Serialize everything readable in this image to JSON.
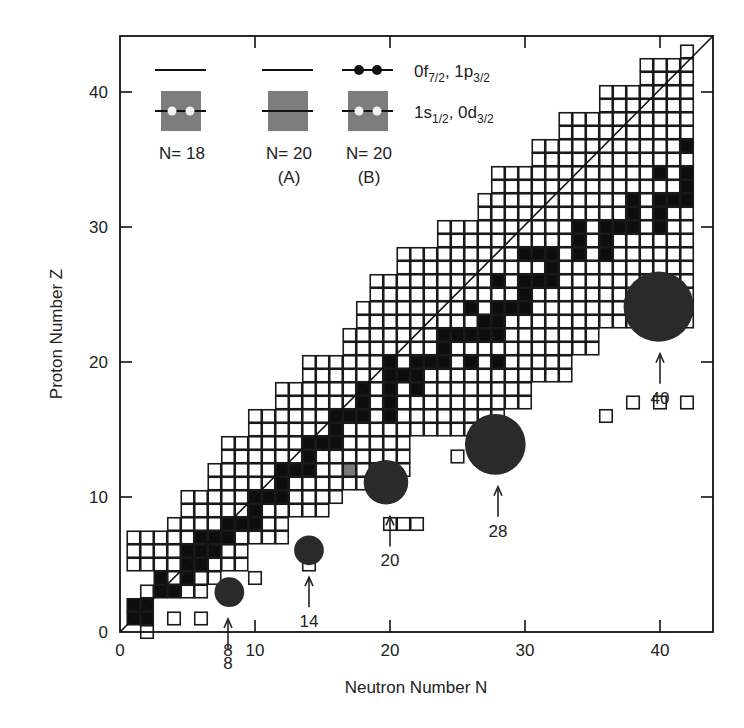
{
  "chart_data": {
    "type": "heatmap",
    "title": "",
    "xlabel": "Neutron Number N",
    "ylabel": "Proton Number Z",
    "xlim": [
      0,
      44
    ],
    "ylim": [
      0,
      44
    ],
    "x_ticks": [
      0,
      10,
      20,
      30,
      40
    ],
    "y_ticks": [
      0,
      10,
      20,
      30,
      40
    ],
    "grid": false,
    "diagonal_line": "N = Z",
    "rows": [
      {
        "z": 1,
        "nmin": 1,
        "nmax": 2
      },
      {
        "z": 2,
        "nmin": 1,
        "nmax": 2
      },
      {
        "z": 3,
        "nmin": 2,
        "nmax": 6
      },
      {
        "z": 4,
        "nmin": 3,
        "nmax": 7
      },
      {
        "z": 5,
        "nmin": 1,
        "nmax": 9
      },
      {
        "z": 6,
        "nmin": 1,
        "nmax": 9
      },
      {
        "z": 7,
        "nmin": 1,
        "nmax": 12
      },
      {
        "z": 8,
        "nmin": 4,
        "nmax": 12
      },
      {
        "z": 9,
        "nmin": 5,
        "nmax": 15
      },
      {
        "z": 10,
        "nmin": 5,
        "nmax": 16
      },
      {
        "z": 11,
        "nmin": 7,
        "nmax": 19
      },
      {
        "z": 12,
        "nmin": 7,
        "nmax": 21
      },
      {
        "z": 13,
        "nmin": 8,
        "nmax": 21
      },
      {
        "z": 14,
        "nmin": 8,
        "nmax": 21
      },
      {
        "z": 15,
        "nmin": 10,
        "nmax": 28
      },
      {
        "z": 16,
        "nmin": 10,
        "nmax": 28
      },
      {
        "z": 17,
        "nmin": 12,
        "nmax": 30
      },
      {
        "z": 18,
        "nmin": 12,
        "nmax": 30
      },
      {
        "z": 19,
        "nmin": 14,
        "nmax": 33
      },
      {
        "z": 20,
        "nmin": 14,
        "nmax": 33
      },
      {
        "z": 21,
        "nmin": 17,
        "nmax": 35
      },
      {
        "z": 22,
        "nmin": 17,
        "nmax": 35
      },
      {
        "z": 23,
        "nmin": 18,
        "nmax": 42
      },
      {
        "z": 24,
        "nmin": 18,
        "nmax": 42
      },
      {
        "z": 25,
        "nmin": 19,
        "nmax": 42
      },
      {
        "z": 26,
        "nmin": 19,
        "nmax": 42
      },
      {
        "z": 27,
        "nmin": 21,
        "nmax": 42
      },
      {
        "z": 28,
        "nmin": 21,
        "nmax": 42
      },
      {
        "z": 29,
        "nmin": 24,
        "nmax": 42
      },
      {
        "z": 30,
        "nmin": 24,
        "nmax": 42
      },
      {
        "z": 31,
        "nmin": 27,
        "nmax": 42
      },
      {
        "z": 32,
        "nmin": 27,
        "nmax": 42
      },
      {
        "z": 33,
        "nmin": 28,
        "nmax": 42
      },
      {
        "z": 34,
        "nmin": 28,
        "nmax": 42
      },
      {
        "z": 35,
        "nmin": 31,
        "nmax": 42
      },
      {
        "z": 36,
        "nmin": 31,
        "nmax": 42
      },
      {
        "z": 37,
        "nmin": 33,
        "nmax": 42
      },
      {
        "z": 38,
        "nmin": 33,
        "nmax": 42
      },
      {
        "z": 39,
        "nmin": 36,
        "nmax": 42
      },
      {
        "z": 40,
        "nmin": 36,
        "nmax": 42
      },
      {
        "z": 41,
        "nmin": 39,
        "nmax": 42
      },
      {
        "z": 42,
        "nmin": 39,
        "nmax": 42
      },
      {
        "z": 43,
        "nmin": 42,
        "nmax": 42
      }
    ],
    "bottom_stubs": [
      {
        "z": 0,
        "n": 2
      },
      {
        "z": 1,
        "n": 4
      },
      {
        "z": 1,
        "n": 6
      },
      {
        "z": 3,
        "n": 8
      },
      {
        "z": 4,
        "n": 10
      },
      {
        "z": 5,
        "n": 14
      },
      {
        "z": 8,
        "n": 20
      },
      {
        "z": 8,
        "n": 21
      },
      {
        "z": 8,
        "n": 22
      },
      {
        "z": 13,
        "n": 25
      },
      {
        "z": 16,
        "n": 36
      },
      {
        "z": 17,
        "n": 38
      },
      {
        "z": 17,
        "n": 40
      },
      {
        "z": 17,
        "n": 42
      }
    ],
    "stable": [
      [
        1,
        1
      ],
      [
        1,
        2
      ],
      [
        2,
        1
      ],
      [
        2,
        2
      ],
      [
        3,
        3
      ],
      [
        3,
        4
      ],
      [
        4,
        3
      ],
      [
        4,
        5
      ],
      [
        5,
        5
      ],
      [
        5,
        6
      ],
      [
        6,
        5
      ],
      [
        6,
        6
      ],
      [
        6,
        7
      ],
      [
        7,
        6
      ],
      [
        7,
        7
      ],
      [
        7,
        8
      ],
      [
        8,
        8
      ],
      [
        8,
        9
      ],
      [
        8,
        10
      ],
      [
        9,
        10
      ],
      [
        10,
        10
      ],
      [
        10,
        11
      ],
      [
        10,
        12
      ],
      [
        11,
        12
      ],
      [
        12,
        12
      ],
      [
        12,
        13
      ],
      [
        12,
        14
      ],
      [
        13,
        14
      ],
      [
        14,
        14
      ],
      [
        14,
        15
      ],
      [
        14,
        16
      ],
      [
        15,
        16
      ],
      [
        16,
        16
      ],
      [
        16,
        17
      ],
      [
        16,
        18
      ],
      [
        16,
        20
      ],
      [
        17,
        18
      ],
      [
        17,
        20
      ],
      [
        18,
        18
      ],
      [
        18,
        20
      ],
      [
        18,
        22
      ],
      [
        19,
        20
      ],
      [
        19,
        21
      ],
      [
        19,
        22
      ],
      [
        20,
        20
      ],
      [
        20,
        22
      ],
      [
        20,
        23
      ],
      [
        20,
        24
      ],
      [
        20,
        26
      ],
      [
        20,
        28
      ],
      [
        21,
        24
      ],
      [
        22,
        24
      ],
      [
        22,
        25
      ],
      [
        22,
        26
      ],
      [
        22,
        27
      ],
      [
        22,
        28
      ],
      [
        23,
        27
      ],
      [
        23,
        28
      ],
      [
        24,
        26
      ],
      [
        24,
        28
      ],
      [
        24,
        29
      ],
      [
        24,
        30
      ],
      [
        25,
        30
      ],
      [
        26,
        28
      ],
      [
        26,
        30
      ],
      [
        26,
        31
      ],
      [
        26,
        32
      ],
      [
        27,
        32
      ],
      [
        28,
        30
      ],
      [
        28,
        31
      ],
      [
        28,
        32
      ],
      [
        28,
        34
      ],
      [
        28,
        36
      ],
      [
        29,
        34
      ],
      [
        29,
        36
      ],
      [
        30,
        34
      ],
      [
        30,
        36
      ],
      [
        30,
        37
      ],
      [
        30,
        38
      ],
      [
        30,
        40
      ],
      [
        31,
        38
      ],
      [
        31,
        40
      ],
      [
        32,
        38
      ],
      [
        32,
        40
      ],
      [
        32,
        41
      ],
      [
        32,
        42
      ],
      [
        33,
        42
      ],
      [
        34,
        40
      ],
      [
        34,
        42
      ],
      [
        34,
        43
      ],
      [
        36,
        42
      ]
    ],
    "gray_cells": [
      [
        12,
        17
      ],
      [
        12,
        19
      ]
    ],
    "magic_circles": [
      {
        "n": 8,
        "cx": 8.1,
        "cy": 2.95,
        "r": 1.1,
        "label": "8"
      },
      {
        "n": 14,
        "cx": 14.0,
        "cy": 6.05,
        "r": 1.1,
        "label": "14"
      },
      {
        "n": 20,
        "cx": 19.7,
        "cy": 11.1,
        "r": 1.65,
        "label": "20"
      },
      {
        "n": 28,
        "cx": 27.8,
        "cy": 13.9,
        "r": 2.25,
        "label": "28"
      },
      {
        "n": 40,
        "cx": 39.9,
        "cy": 24.1,
        "r": 2.6,
        "label": "40"
      }
    ]
  },
  "legend": {
    "orbitals": [
      {
        "main": "0f",
        "sub": "7/2",
        "sep": ", ",
        "main2": "1p",
        "sub2": "3/2"
      },
      {
        "main": "1s",
        "sub": "1/2",
        "sep": ", ",
        "main2": "0d",
        "sub2": "3/2"
      }
    ],
    "configs": [
      {
        "label": "N= 18",
        "sub": ""
      },
      {
        "label": "N= 20",
        "sub": "(A)"
      },
      {
        "label": "N= 20",
        "sub": "(B)"
      }
    ]
  },
  "colors": {
    "cell_border": "#1a1a1a",
    "stable": "#0d0d0d",
    "gray": "#7a7a7a",
    "circle": "#2a2a2a",
    "legend_box": "#7d7d7d"
  }
}
